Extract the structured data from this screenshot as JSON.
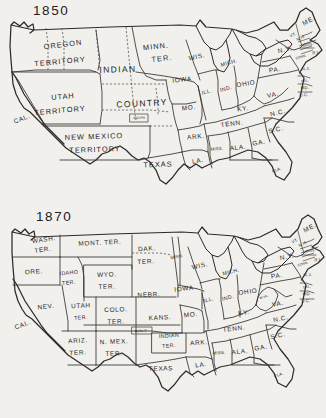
{
  "page": {
    "background_color": "#f2f0ec",
    "ink_color": "#2b2a28"
  },
  "maps": [
    {
      "id": "map-1850",
      "year_label": "1850",
      "labels": [
        {
          "name": "oregon-territory",
          "text": "OREGON",
          "x": 63,
          "y": 45,
          "size": "sz-lg",
          "rotate": -7
        },
        {
          "name": "oregon-territory-2",
          "text": "TERRITORY",
          "x": 60,
          "y": 62,
          "size": "sz-lg",
          "rotate": -5
        },
        {
          "name": "indian-country",
          "text": "INDIAN",
          "x": 118,
          "y": 70,
          "size": "sz-xl",
          "rotate": -2
        },
        {
          "name": "indian-country-2",
          "text": "COUNTRY",
          "x": 142,
          "y": 104,
          "size": "sz-xl",
          "rotate": -3
        },
        {
          "name": "minnesota-territory",
          "text": "MINN.",
          "x": 156,
          "y": 47,
          "size": "sz-lg",
          "rotate": -6
        },
        {
          "name": "minnesota-territory-2",
          "text": "TER.",
          "x": 162,
          "y": 59,
          "size": "sz-lg",
          "rotate": -6
        },
        {
          "name": "utah-territory",
          "text": "UTAH",
          "x": 63,
          "y": 97,
          "size": "sz-lg",
          "rotate": -5
        },
        {
          "name": "utah-territory-2",
          "text": "TERRITORY",
          "x": 60,
          "y": 111,
          "size": "sz-lg",
          "rotate": -5
        },
        {
          "name": "new-mexico-territory",
          "text": "NEW MEXICO",
          "x": 94,
          "y": 137,
          "size": "sz-lg",
          "rotate": -2
        },
        {
          "name": "new-mexico-territory-2",
          "text": "TERRITORY",
          "x": 95,
          "y": 150,
          "size": "sz-lg",
          "rotate": -2
        },
        {
          "name": "california",
          "text": "CAL.",
          "x": 22,
          "y": 119,
          "size": "sz-md",
          "rotate": -22
        },
        {
          "name": "texas",
          "text": "TEXAS",
          "x": 158,
          "y": 165,
          "size": "sz-lg",
          "rotate": -2
        },
        {
          "name": "indian-small",
          "text": "INDIAN",
          "x": 139,
          "y": 118,
          "size": "sz-tiny",
          "rotate": -4
        },
        {
          "name": "wisconsin",
          "text": "WIS.",
          "x": 197,
          "y": 57,
          "size": "sz-md",
          "rotate": -12
        },
        {
          "name": "michigan",
          "text": "MICH.",
          "x": 229,
          "y": 63,
          "size": "sz-sm",
          "rotate": -16
        },
        {
          "name": "iowa",
          "text": "IOWA",
          "x": 182,
          "y": 80,
          "size": "sz-md",
          "rotate": -6
        },
        {
          "name": "illinois",
          "text": "ILL.",
          "x": 207,
          "y": 92,
          "size": "sz-sm",
          "rotate": -14
        },
        {
          "name": "indiana",
          "text": "IND.",
          "x": 226,
          "y": 89,
          "size": "sz-sm",
          "rotate": -14
        },
        {
          "name": "ohio",
          "text": "OHIO",
          "x": 246,
          "y": 84,
          "size": "sz-md",
          "rotate": -9
        },
        {
          "name": "missouri",
          "text": "MO.",
          "x": 189,
          "y": 108,
          "size": "sz-md",
          "rotate": -6
        },
        {
          "name": "kentucky",
          "text": "KY.",
          "x": 243,
          "y": 109,
          "size": "sz-md",
          "rotate": -8
        },
        {
          "name": "virginia",
          "text": "VA.",
          "x": 273,
          "y": 95,
          "size": "sz-md",
          "rotate": -13
        },
        {
          "name": "tennessee",
          "text": "TENN.",
          "x": 232,
          "y": 124,
          "size": "sz-md",
          "rotate": -8
        },
        {
          "name": "north-carolina",
          "text": "N.C.",
          "x": 278,
          "y": 113,
          "size": "sz-md",
          "rotate": -14
        },
        {
          "name": "arkansas",
          "text": "ARK.",
          "x": 196,
          "y": 137,
          "size": "sz-md",
          "rotate": -5
        },
        {
          "name": "south-carolina",
          "text": "S.C.",
          "x": 276,
          "y": 130,
          "size": "sz-md",
          "rotate": -14
        },
        {
          "name": "mississippi",
          "text": "MISS.",
          "x": 217,
          "y": 149,
          "size": "sz-xs",
          "rotate": -6
        },
        {
          "name": "alabama",
          "text": "ALA.",
          "x": 238,
          "y": 148,
          "size": "sz-md",
          "rotate": -6
        },
        {
          "name": "georgia",
          "text": "GA.",
          "x": 259,
          "y": 143,
          "size": "sz-md",
          "rotate": -10
        },
        {
          "name": "louisiana",
          "text": "LA.",
          "x": 198,
          "y": 161,
          "size": "sz-md",
          "rotate": -10
        },
        {
          "name": "florida",
          "text": "FLA.",
          "x": 277,
          "y": 170,
          "size": "sz-xs",
          "rotate": -22
        },
        {
          "name": "pennsylvania",
          "text": "PA.",
          "x": 275,
          "y": 70,
          "size": "sz-md",
          "rotate": -8
        },
        {
          "name": "new-york",
          "text": "N.Y.",
          "x": 285,
          "y": 50,
          "size": "sz-md",
          "rotate": -12
        },
        {
          "name": "maine",
          "text": "ME.",
          "x": 309,
          "y": 21,
          "size": "sz-md",
          "rotate": -28
        },
        {
          "name": "vermont",
          "text": "VT.",
          "x": 293,
          "y": 35,
          "size": "sz-xs",
          "rotate": -26
        },
        {
          "name": "new-hampshire",
          "text": "N.H.",
          "x": 301,
          "y": 38,
          "size": "sz-xs",
          "rotate": -28
        },
        {
          "name": "massachusetts",
          "text": "MASS.",
          "x": 308,
          "y": 45,
          "size": "sz-tiny",
          "rotate": -12
        },
        {
          "name": "rhode-island",
          "text": "R.I.",
          "x": 316,
          "y": 53,
          "size": "sz-xs",
          "rotate": -6
        },
        {
          "name": "connecticut",
          "text": "CONN.",
          "x": 301,
          "y": 57,
          "size": "sz-tiny",
          "rotate": -18
        },
        {
          "name": "new-jersey",
          "text": "N.J.",
          "x": 306,
          "y": 69,
          "size": "sz-xs",
          "rotate": -4
        },
        {
          "name": "delaware",
          "text": "DEL.",
          "x": 305,
          "y": 81,
          "size": "sz-tiny",
          "rotate": -4
        },
        {
          "name": "maryland",
          "text": "MD.",
          "x": 305,
          "y": 88,
          "size": "sz-xs",
          "rotate": -4
        },
        {
          "name": "district-of-columbia",
          "text": "D.C.",
          "x": 304,
          "y": 95,
          "size": "sz-xs",
          "rotate": -4
        }
      ]
    },
    {
      "id": "map-1870",
      "year_label": "1870",
      "labels": [
        {
          "name": "washington-territory",
          "text": "WASH.",
          "x": 44,
          "y": 35,
          "size": "sz-md",
          "rotate": -8
        },
        {
          "name": "washington-territory-2",
          "text": "TER.",
          "x": 43,
          "y": 45,
          "size": "sz-md",
          "rotate": -8
        },
        {
          "name": "montana-territory",
          "text": "MONT. TER.",
          "x": 100,
          "y": 38,
          "size": "sz-md",
          "rotate": -3
        },
        {
          "name": "dakota-territory",
          "text": "DAK.",
          "x": 147,
          "y": 44,
          "size": "sz-md",
          "rotate": -4
        },
        {
          "name": "dakota-territory-2",
          "text": "TER.",
          "x": 146,
          "y": 57,
          "size": "sz-md",
          "rotate": -4
        },
        {
          "name": "oregon",
          "text": "ORE.",
          "x": 34,
          "y": 67,
          "size": "sz-md",
          "rotate": -3
        },
        {
          "name": "idaho-territory",
          "text": "IDAHO",
          "x": 69,
          "y": 68,
          "size": "sz-sm",
          "rotate": -6
        },
        {
          "name": "idaho-territory-2",
          "text": "TER.",
          "x": 69,
          "y": 78,
          "size": "sz-sm",
          "rotate": -6
        },
        {
          "name": "wyoming-territory",
          "text": "WYO.",
          "x": 107,
          "y": 70,
          "size": "sz-md",
          "rotate": -2
        },
        {
          "name": "wyoming-territory-2",
          "text": "TER.",
          "x": 107,
          "y": 82,
          "size": "sz-md",
          "rotate": -2
        },
        {
          "name": "minnesota",
          "text": "MINN.",
          "x": 177,
          "y": 52,
          "size": "sz-xs",
          "rotate": -10
        },
        {
          "name": "wisconsin",
          "text": "WIS.",
          "x": 200,
          "y": 61,
          "size": "sz-md",
          "rotate": -12
        },
        {
          "name": "michigan",
          "text": "MICH.",
          "x": 231,
          "y": 67,
          "size": "sz-sm",
          "rotate": -14
        },
        {
          "name": "nebraska",
          "text": "NEBR.",
          "x": 149,
          "y": 90,
          "size": "sz-md",
          "rotate": -3
        },
        {
          "name": "iowa",
          "text": "IOWA",
          "x": 184,
          "y": 84,
          "size": "sz-md",
          "rotate": -6
        },
        {
          "name": "nevada",
          "text": "NEV.",
          "x": 46,
          "y": 102,
          "size": "sz-md",
          "rotate": -6
        },
        {
          "name": "utah-territory",
          "text": "UTAH",
          "x": 81,
          "y": 101,
          "size": "sz-md",
          "rotate": -3
        },
        {
          "name": "utah-territory-2",
          "text": "TER.",
          "x": 81,
          "y": 113,
          "size": "sz-sm",
          "rotate": -3
        },
        {
          "name": "colorado-territory",
          "text": "COLO.",
          "x": 116,
          "y": 105,
          "size": "sz-md",
          "rotate": -2
        },
        {
          "name": "colorado-territory-2",
          "text": "TER.",
          "x": 116,
          "y": 117,
          "size": "sz-md",
          "rotate": -2
        },
        {
          "name": "kansas",
          "text": "KANS.",
          "x": 160,
          "y": 113,
          "size": "sz-md",
          "rotate": -3
        },
        {
          "name": "california",
          "text": "CAL.",
          "x": 23,
          "y": 120,
          "size": "sz-md",
          "rotate": -20
        },
        {
          "name": "arizona-territory",
          "text": "ARIZ.",
          "x": 78,
          "y": 136,
          "size": "sz-md",
          "rotate": -3
        },
        {
          "name": "arizona-territory-2",
          "text": "TER.",
          "x": 78,
          "y": 148,
          "size": "sz-md",
          "rotate": -3
        },
        {
          "name": "new-mexico-territory",
          "text": "N. MEX.",
          "x": 114,
          "y": 137,
          "size": "sz-md",
          "rotate": -2
        },
        {
          "name": "new-mexico-territory-2",
          "text": "TER.",
          "x": 114,
          "y": 149,
          "size": "sz-md",
          "rotate": -2
        },
        {
          "name": "indian-territory",
          "text": "INDIAN",
          "x": 169,
          "y": 131,
          "size": "sz-sm",
          "rotate": -4
        },
        {
          "name": "indian-territory-2",
          "text": "TER.",
          "x": 169,
          "y": 141,
          "size": "sz-sm",
          "rotate": -4
        },
        {
          "name": "indian-small",
          "text": "PUBLIC",
          "x": 141,
          "y": 126,
          "size": "sz-tiny",
          "rotate": -4
        },
        {
          "name": "texas",
          "text": "TEXAS",
          "x": 161,
          "y": 164,
          "size": "sz-md",
          "rotate": -2
        },
        {
          "name": "illinois",
          "text": "ILL.",
          "x": 209,
          "y": 95,
          "size": "sz-sm",
          "rotate": -14
        },
        {
          "name": "indiana",
          "text": "IND.",
          "x": 228,
          "y": 93,
          "size": "sz-sm",
          "rotate": -14
        },
        {
          "name": "ohio",
          "text": "OHIO",
          "x": 248,
          "y": 87,
          "size": "sz-md",
          "rotate": -8
        },
        {
          "name": "missouri",
          "text": "MO.",
          "x": 191,
          "y": 110,
          "size": "sz-md",
          "rotate": -5
        },
        {
          "name": "kentucky",
          "text": "KY.",
          "x": 244,
          "y": 108,
          "size": "sz-md",
          "rotate": -8
        },
        {
          "name": "west-virginia",
          "text": "W.VA.",
          "x": 264,
          "y": 92,
          "size": "sz-tiny",
          "rotate": -16
        },
        {
          "name": "virginia",
          "text": "VA.",
          "x": 278,
          "y": 99,
          "size": "sz-md",
          "rotate": -10
        },
        {
          "name": "tennessee",
          "text": "TENN.",
          "x": 234,
          "y": 124,
          "size": "sz-md",
          "rotate": -7
        },
        {
          "name": "north-carolina",
          "text": "N.C.",
          "x": 281,
          "y": 114,
          "size": "sz-md",
          "rotate": -12
        },
        {
          "name": "arkansas",
          "text": "ARK.",
          "x": 199,
          "y": 138,
          "size": "sz-md",
          "rotate": -4
        },
        {
          "name": "south-carolina",
          "text": "S.C.",
          "x": 278,
          "y": 131,
          "size": "sz-md",
          "rotate": -13
        },
        {
          "name": "mississippi",
          "text": "MISS.",
          "x": 219,
          "y": 148,
          "size": "sz-xs",
          "rotate": -5
        },
        {
          "name": "alabama",
          "text": "ALA.",
          "x": 240,
          "y": 147,
          "size": "sz-md",
          "rotate": -5
        },
        {
          "name": "georgia",
          "text": "GA.",
          "x": 261,
          "y": 143,
          "size": "sz-md",
          "rotate": -10
        },
        {
          "name": "louisiana",
          "text": "LA.",
          "x": 201,
          "y": 160,
          "size": "sz-md",
          "rotate": -8
        },
        {
          "name": "florida",
          "text": "FLA.",
          "x": 279,
          "y": 170,
          "size": "sz-xs",
          "rotate": -22
        },
        {
          "name": "pennsylvania",
          "text": "PA.",
          "x": 277,
          "y": 71,
          "size": "sz-md",
          "rotate": -8
        },
        {
          "name": "new-york",
          "text": "N.Y.",
          "x": 287,
          "y": 52,
          "size": "sz-md",
          "rotate": -12
        },
        {
          "name": "maine",
          "text": "ME.",
          "x": 310,
          "y": 23,
          "size": "sz-md",
          "rotate": -28
        },
        {
          "name": "vermont",
          "text": "VT.",
          "x": 295,
          "y": 36,
          "size": "sz-xs",
          "rotate": -26
        },
        {
          "name": "new-hampshire",
          "text": "N.H.",
          "x": 303,
          "y": 39,
          "size": "sz-xs",
          "rotate": -28
        },
        {
          "name": "massachusetts",
          "text": "MASS.",
          "x": 310,
          "y": 46,
          "size": "sz-tiny",
          "rotate": -12
        },
        {
          "name": "rhode-island",
          "text": "R.I.",
          "x": 318,
          "y": 55,
          "size": "sz-xs",
          "rotate": -6
        },
        {
          "name": "connecticut",
          "text": "CONN.",
          "x": 303,
          "y": 59,
          "size": "sz-tiny",
          "rotate": -18
        },
        {
          "name": "new-jersey",
          "text": "N.J.",
          "x": 308,
          "y": 70,
          "size": "sz-xs",
          "rotate": -4
        },
        {
          "name": "delaware",
          "text": "DEL.",
          "x": 307,
          "y": 82,
          "size": "sz-tiny",
          "rotate": -4
        },
        {
          "name": "maryland",
          "text": "MD.",
          "x": 307,
          "y": 89,
          "size": "sz-xs",
          "rotate": -4
        },
        {
          "name": "district-of-columbia",
          "text": "D.C.",
          "x": 306,
          "y": 96,
          "size": "sz-xs",
          "rotate": -4
        }
      ]
    }
  ]
}
